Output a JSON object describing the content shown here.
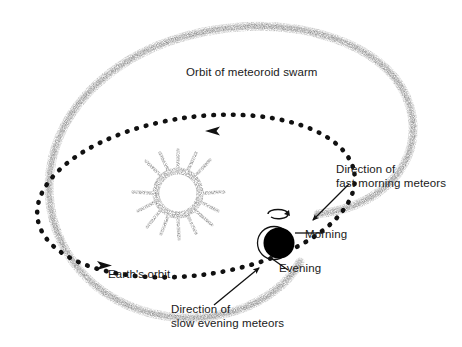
{
  "figure": {
    "background_color": "#ffffff",
    "width": 462,
    "height": 347
  },
  "labels": {
    "swarm_orbit": "Orbit of meteoroid swarm",
    "earth_orbit": "Earth's orbit",
    "morning": "Morning",
    "evening": "Evening",
    "fast_morning_line1": "Direction of",
    "fast_morning_line2": "fast morning meteors",
    "slow_evening_line1": "Direction of",
    "slow_evening_line2": "slow evening meteors"
  },
  "colors": {
    "text": "#1a1a1a",
    "earth_orbit_dots": "#111111",
    "swarm_band": "#b9b9b9",
    "sun_stipple": "#8a8a8a",
    "earth_fill": "#000000",
    "leader_line": "#111111"
  },
  "objects": {
    "sun": {
      "name": "sun",
      "cx": 178,
      "cy": 193,
      "radius": 25
    },
    "earth": {
      "name": "earth",
      "cx": 277,
      "cy": 243,
      "radius": 15
    },
    "earth_orbit": {
      "type": "dotted-ellipse",
      "cx": 196,
      "cy": 196,
      "rx": 160,
      "ry": 79,
      "rotation_deg": -8,
      "direction": "counterclockwise"
    },
    "swarm_orbit": {
      "type": "stippled-loop",
      "direction": "counterclockwise"
    }
  },
  "arrows": {
    "earth_orbit_top": {
      "points": "left",
      "x": 212,
      "y": 127
    },
    "earth_orbit_bottom": {
      "points": "right",
      "x": 105,
      "y": 265
    },
    "earth_rotation": {
      "points": "counterclockwise",
      "x": 277,
      "y": 212
    },
    "fast_morning": {
      "from": [
        347,
        186
      ],
      "to": [
        314,
        219
      ]
    },
    "slow_evening": {
      "from": [
        216,
        303
      ],
      "to": [
        258,
        269
      ]
    }
  }
}
